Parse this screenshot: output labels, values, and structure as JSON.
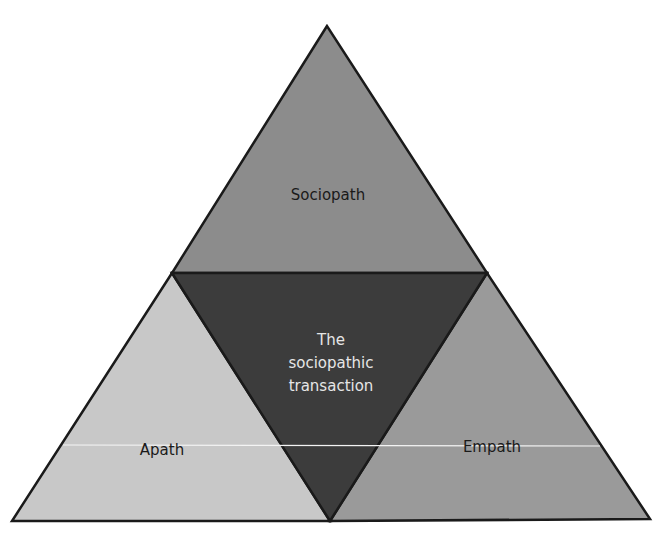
{
  "diagram": {
    "regions": {
      "sociopath": {
        "label": "Sociopath",
        "fill": "#8c8c8c"
      },
      "transaction": {
        "lines": [
          "The",
          "sociopathic",
          "transaction"
        ],
        "fill": "#3c3c3c",
        "text_color": "#e6e6e6"
      },
      "apath": {
        "label": "Apath",
        "fill": "#c8c8c8"
      },
      "empath": {
        "label": "Empath",
        "fill": "#9a9a9a"
      }
    },
    "outline_color": "#1a1a1a",
    "background": "#ffffff"
  }
}
